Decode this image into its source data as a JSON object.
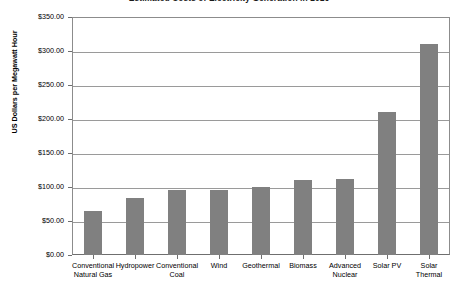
{
  "chart_data": {
    "type": "bar",
    "title": "Estimated Costs of Electricity Generation in 2016",
    "xlabel": "",
    "ylabel": "US Dollars per Megawatt Hour",
    "ylim": [
      0,
      350
    ],
    "ytick_step": 50,
    "grid": true,
    "legend": null,
    "bar_color": "#808080",
    "categories": [
      "Conventional Natural Gas",
      "Hydropower",
      "Conventional Coal",
      "Wind",
      "Geothermal",
      "Biomass",
      "Advanced Nuclear",
      "Solar PV",
      "Solar Thermal"
    ],
    "category_lines": [
      [
        "Conventional",
        "Natural Gas"
      ],
      [
        "Hydropower"
      ],
      [
        "Conventional",
        "Coal"
      ],
      [
        "Wind"
      ],
      [
        "Geothermal"
      ],
      [
        "Biomass"
      ],
      [
        "Advanced",
        "Nuclear"
      ],
      [
        "Solar PV"
      ],
      [
        "Solar Thermal"
      ]
    ],
    "values": [
      65,
      84,
      95,
      96,
      100,
      110,
      112,
      210,
      310
    ],
    "ytick_labels": [
      "$350.00",
      "$300.00",
      "$250.00",
      "$200.00",
      "$150.00",
      "$100.00",
      "$50.00",
      "$0.00"
    ],
    "ytick_values": [
      350,
      300,
      250,
      200,
      150,
      100,
      50,
      0
    ]
  }
}
